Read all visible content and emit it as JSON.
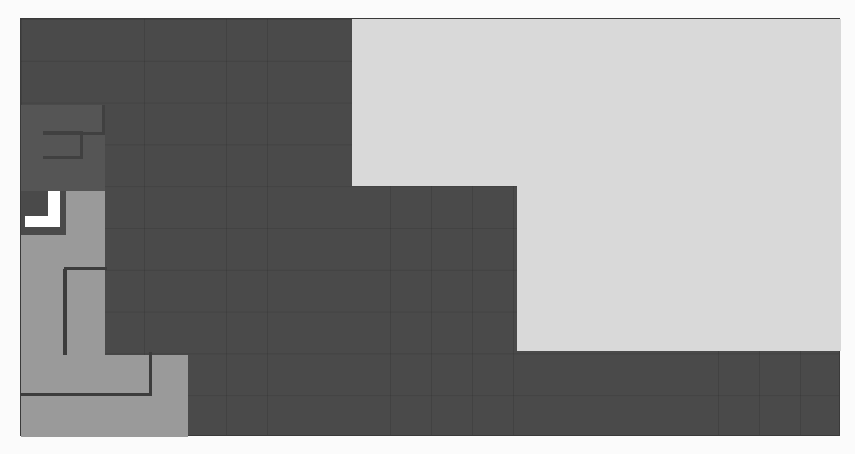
{
  "caption": {
    "text": ""
  },
  "board": {
    "columns": 20,
    "rows": 10,
    "colors": {
      "empty": "#4a4a4a",
      "cleared_area": "#d9d9d9",
      "piece": "#9a9a9a",
      "shadow_piece": "#555555",
      "outline": "#3c3c3c",
      "active_marker": "#ffffff",
      "background": "#fbfbfb"
    }
  }
}
